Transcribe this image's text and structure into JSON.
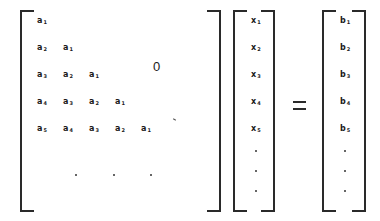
{
  "equation": {
    "description": "Lower triangular Toeplitz system A x = b",
    "matrix": {
      "rows": [
        [
          "a",
          "1"
        ],
        [
          "a",
          "2",
          "a",
          "1"
        ],
        [
          "a",
          "3",
          "a",
          "2",
          "a",
          "1"
        ],
        [
          "a",
          "4",
          "a",
          "3",
          "a",
          "2",
          "a",
          "1"
        ],
        [
          "a",
          "5",
          "a",
          "4",
          "a",
          "3",
          "a",
          "2",
          "a",
          "1"
        ]
      ],
      "upper_label": "0",
      "continuation": "· · ·"
    },
    "x_vector": [
      "x1",
      "x2",
      "x3",
      "x4",
      "x5",
      "·",
      "·",
      "·"
    ],
    "equals": "=",
    "b_vector": [
      "b1",
      "b2",
      "b3",
      "b4",
      "b5",
      "·",
      "·",
      "·"
    ]
  }
}
